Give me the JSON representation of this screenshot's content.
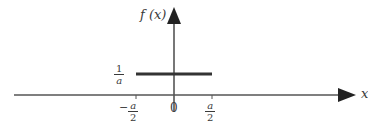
{
  "diagram": {
    "y_axis_label": "f (x)",
    "x_axis_label": "x",
    "pulse_height_label": {
      "numerator": "1",
      "denominator": "a"
    },
    "x_ticks": [
      {
        "sign": "−",
        "numerator": "a",
        "denominator": "2"
      },
      {
        "label": "0"
      },
      {
        "sign": "",
        "numerator": "a",
        "denominator": "2"
      }
    ],
    "colors": {
      "axis": "#555555",
      "pulse": "#333333",
      "text": "#3a3a3a"
    }
  }
}
